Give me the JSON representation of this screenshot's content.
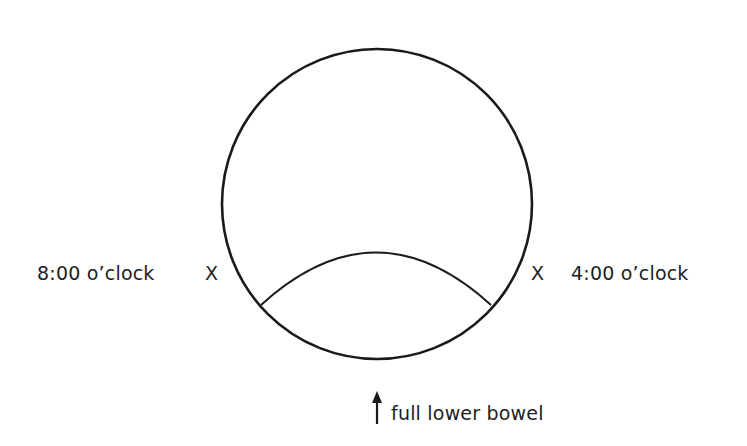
{
  "diagram": {
    "type": "anatomical position diagram",
    "stroke_color": "#1a1a1a",
    "background_color": "#ffffff",
    "circle": {
      "center_x": 377,
      "center_y": 204,
      "radius": 155
    },
    "inner_arc": {
      "start": [
        261,
        305
      ],
      "apex": [
        376,
        252
      ],
      "end": [
        491,
        305
      ]
    },
    "labels": {
      "left_position": "8:00 o’clock",
      "right_position": "4:00 o’clock",
      "left_marker": "X",
      "right_marker": "X",
      "bottom_annotation": "full lower bowel"
    },
    "arrow": {
      "direction": "up",
      "x": 377,
      "y_top": 393,
      "y_bottom": 424
    }
  }
}
